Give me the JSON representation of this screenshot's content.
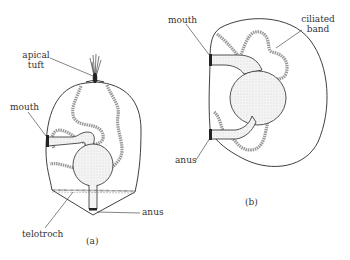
{
  "figure_a": {
    "caption": "(a)",
    "labels": {
      "apical_tuft_line1": "apical",
      "apical_tuft_line2": "tuft",
      "mouth": "mouth",
      "telotroch": "telotroch",
      "anus": "anus"
    }
  },
  "figure_b": {
    "caption": "(b)",
    "labels": {
      "mouth": "mouth",
      "ciliated_band_line1": "ciliated",
      "ciliated_band_line2": "band",
      "anus": "anus"
    }
  },
  "colors": {
    "outline": "#2a2a2a",
    "band": "#9a9a9a",
    "gut_fill": "#f0f0f0",
    "text": "#333333"
  }
}
